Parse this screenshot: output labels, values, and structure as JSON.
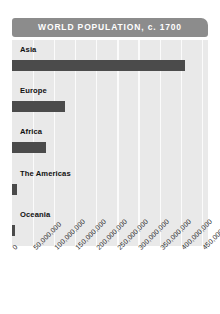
{
  "chart_data": {
    "type": "bar",
    "orientation": "horizontal",
    "title": "WORLD POPULATION, c. 1700",
    "xlabel": "",
    "ylabel": "",
    "categories": [
      "Asia",
      "Europe",
      "Africa",
      "The Americas",
      "Oceania"
    ],
    "values": [
      410000000,
      125000000,
      80000000,
      13000000,
      8000000
    ],
    "xlim": [
      0,
      465000000
    ],
    "xticks": [
      0,
      50000000,
      100000000,
      150000000,
      200000000,
      250000000,
      300000000,
      350000000,
      400000000,
      450000000
    ],
    "xticklabels": [
      "0",
      "50,000,000",
      "100,000,000",
      "150,000,000",
      "200,000,000",
      "250,000,000",
      "300,000,000",
      "350,000,000",
      "400,000,000",
      "450,000,000"
    ],
    "grid": true,
    "grid_axis": "x",
    "legend": false,
    "colors": {
      "bar": "#4b4b4b",
      "plot_background": "#e9e9e9",
      "gridline": "#fbfbfb",
      "title_banner": "#8c8c8c",
      "title_text": "#ffffff",
      "label_text": "#111111",
      "tick_text": "#2b2b2b",
      "figure_background": "#ffffff"
    }
  }
}
